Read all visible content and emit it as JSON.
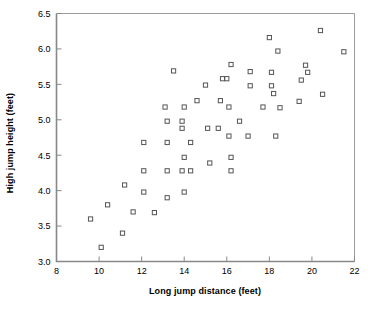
{
  "chart_data": {
    "type": "scatter",
    "title": "",
    "xlabel": "Long jump distance (feet)",
    "ylabel": "High jump height (feet)",
    "xlim": [
      8,
      22
    ],
    "ylim": [
      3.0,
      6.5
    ],
    "xticks": [
      8,
      10,
      12,
      14,
      16,
      18,
      20,
      22
    ],
    "xtick_labels": [
      "8",
      "10",
      "12",
      "14",
      "16",
      "18",
      "20",
      "22"
    ],
    "yticks": [
      3.0,
      3.5,
      4.0,
      4.5,
      5.0,
      5.5,
      6.0,
      6.5
    ],
    "ytick_labels": [
      "3.0",
      "3.5",
      "4.0",
      "4.5",
      "5.0",
      "5.5",
      "6.0",
      "6.5"
    ],
    "grid": false,
    "legend": null,
    "marker": "open-square",
    "marker_color": "#555555",
    "frame_color": "#888888",
    "series": [
      {
        "name": "athletes",
        "points": [
          [
            9.6,
            3.6
          ],
          [
            10.1,
            3.2
          ],
          [
            10.4,
            3.8
          ],
          [
            11.1,
            3.4
          ],
          [
            11.2,
            4.08
          ],
          [
            11.6,
            3.7
          ],
          [
            12.1,
            4.68
          ],
          [
            12.1,
            4.28
          ],
          [
            12.1,
            3.98
          ],
          [
            12.6,
            3.69
          ],
          [
            13.1,
            5.18
          ],
          [
            13.2,
            4.98
          ],
          [
            13.2,
            4.68
          ],
          [
            13.2,
            4.28
          ],
          [
            13.2,
            3.9
          ],
          [
            13.5,
            5.69
          ],
          [
            13.9,
            4.98
          ],
          [
            13.9,
            4.88
          ],
          [
            13.9,
            4.28
          ],
          [
            14.0,
            5.18
          ],
          [
            14.0,
            4.47
          ],
          [
            14.0,
            3.98
          ],
          [
            14.3,
            4.68
          ],
          [
            14.3,
            4.28
          ],
          [
            14.6,
            5.27
          ],
          [
            15.0,
            5.49
          ],
          [
            15.1,
            4.88
          ],
          [
            15.2,
            4.39
          ],
          [
            15.6,
            4.88
          ],
          [
            15.7,
            5.27
          ],
          [
            15.8,
            5.58
          ],
          [
            16.0,
            5.58
          ],
          [
            16.1,
            5.18
          ],
          [
            16.1,
            4.77
          ],
          [
            16.2,
            5.78
          ],
          [
            16.2,
            4.47
          ],
          [
            16.2,
            4.28
          ],
          [
            16.6,
            4.98
          ],
          [
            17.0,
            4.77
          ],
          [
            17.1,
            5.68
          ],
          [
            17.1,
            5.48
          ],
          [
            17.7,
            5.18
          ],
          [
            18.0,
            6.16
          ],
          [
            18.1,
            5.67
          ],
          [
            18.1,
            5.48
          ],
          [
            18.2,
            5.37
          ],
          [
            18.3,
            4.77
          ],
          [
            18.4,
            5.97
          ],
          [
            18.5,
            5.17
          ],
          [
            19.4,
            5.26
          ],
          [
            19.5,
            5.56
          ],
          [
            19.7,
            5.77
          ],
          [
            19.8,
            5.67
          ],
          [
            20.4,
            6.26
          ],
          [
            20.5,
            5.36
          ],
          [
            21.5,
            5.96
          ]
        ]
      }
    ]
  }
}
